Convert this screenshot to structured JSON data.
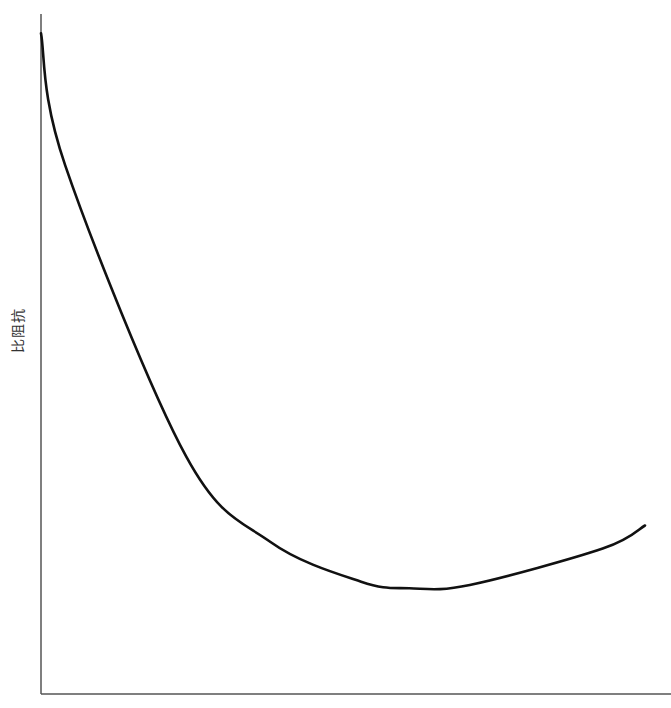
{
  "chart_data": {
    "type": "line",
    "title": "",
    "xlabel": "",
    "ylabel": "比阻抗",
    "grid": false,
    "legend": null,
    "axis_ticks": {
      "x": [],
      "y": []
    },
    "note": "Qualitative U-shaped curve; no numeric tick labels shown. Values are normalized (0-1) readings from pixel positions.",
    "x": [
      0.0,
      0.04,
      0.24,
      0.38,
      0.53,
      0.61,
      0.71,
      0.93,
      1.0
    ],
    "series": [
      {
        "name": "比阻抗",
        "values": [
          1.0,
          0.8,
          0.36,
          0.23,
          0.17,
          0.16,
          0.165,
          0.22,
          0.255
        ]
      }
    ],
    "xlim": [
      0,
      1
    ],
    "ylim": [
      0,
      1.02
    ]
  },
  "style": {
    "axis_color": "#555555",
    "curve_color": "#111111",
    "label_color": "#333333"
  }
}
